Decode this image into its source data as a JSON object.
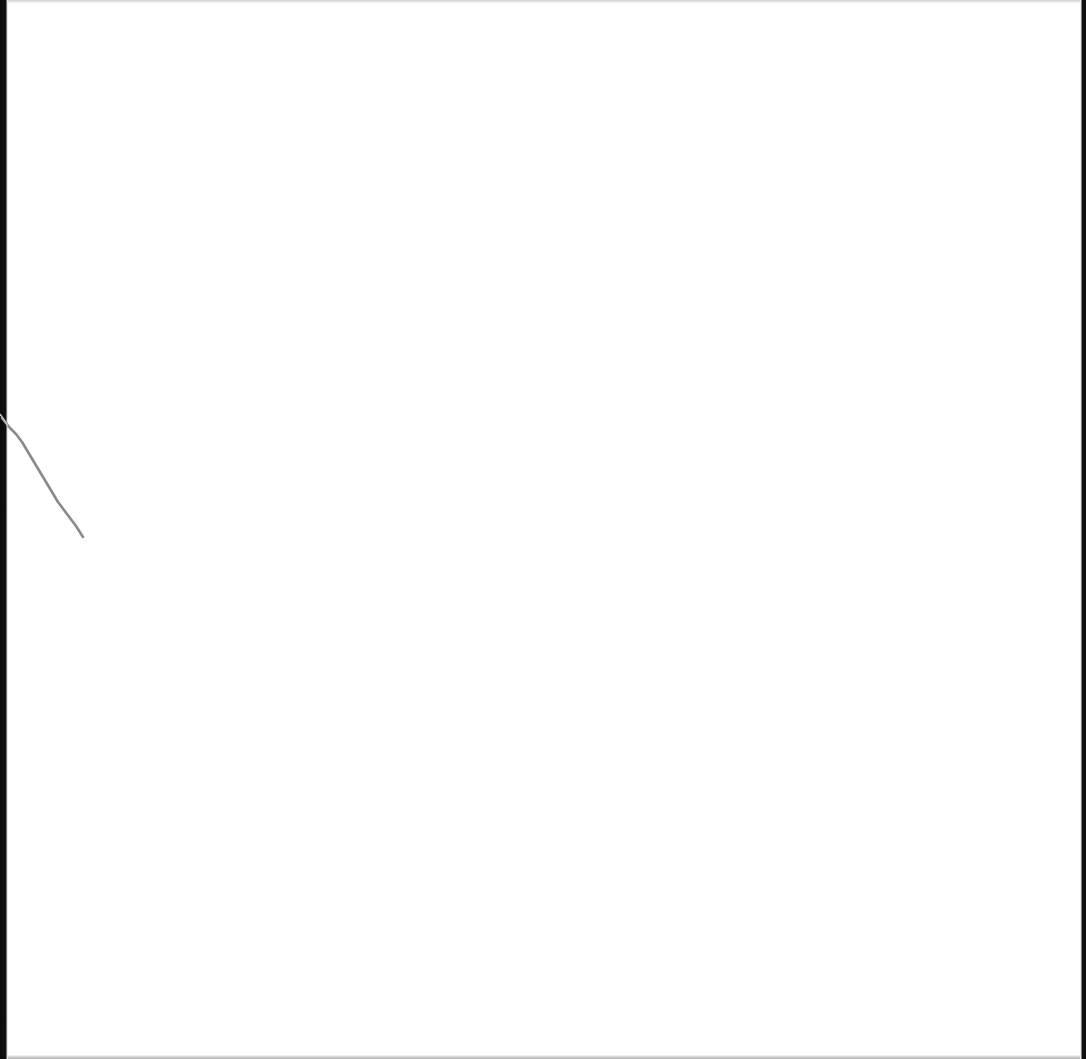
{
  "page": {
    "background": "#ffffff",
    "border_color": "#0a0a0a",
    "mark_color": "#8a8a8a",
    "text": ""
  }
}
